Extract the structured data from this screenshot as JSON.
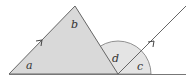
{
  "diagram": {
    "labels": {
      "a": "a",
      "b": "b",
      "c": "c",
      "d": "d"
    },
    "colors": {
      "triangle_fill": "#dcdcdc",
      "angle_fill": "#e6e6e6",
      "line": "#666666",
      "background": "#ffffff"
    }
  }
}
